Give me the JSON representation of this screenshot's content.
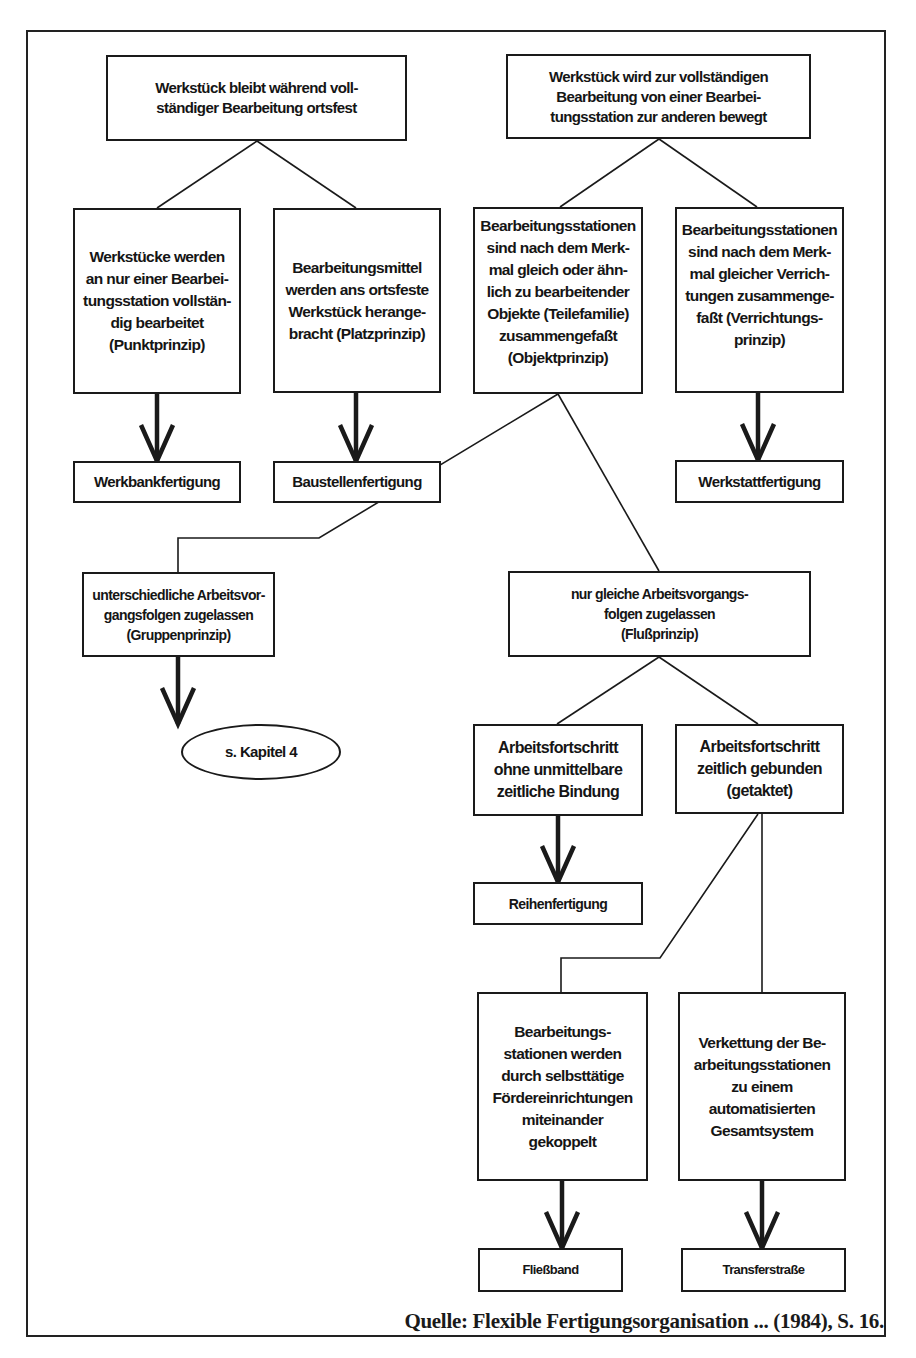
{
  "diagram": {
    "title_nodes": {
      "stationary": "Werkstück bleibt während voll-\nständiger Bearbeitung ortsfest",
      "moving": "Werkstück wird zur vollständigen\nBearbeitung von einer Bearbei-\ntungsstation zur anderen bewegt"
    },
    "nodes": {
      "punktprinzip": "Werkstücke werden\nan nur einer Bearbei-\ntungsstation vollstän-\ndig bearbeitet\n(Punktprinzip)",
      "platzprinzip": "Bearbeitungsmittel\nwerden ans ortsfeste\nWerkstück herange-\nbracht (Platzprinzip)",
      "objektprinzip": "Bearbeitungsstationen\nsind nach dem Merk-\nmal gleich oder ähn-\nlich zu bearbeitender\nObjekte (Teilefamilie)\nzusammengefaßt\n(Objektprinzip)",
      "verrichtungsprinzip": "Bearbeitungsstationen\nsind nach dem Merk-\nmal gleicher Verrich-\ntungen zusammenge-\nfaßt (Verrichtungs-\nprinzip)",
      "werkbankfertigung": "Werkbankfertigung",
      "baustellenfertigung": "Baustellenfertigung",
      "werkstattfertigung": "Werkstattfertigung",
      "gruppenprinzip": "unterschiedliche Arbeitsvor-\ngangsfolgen zugelassen\n(Gruppenprinzip)",
      "flussprinzip": "nur gleiche Arbeitsvorgangs-\nfolgen zugelassen\n(Flußprinzip)",
      "kapitel4": "s. Kapitel 4",
      "ungebunden": "Arbeitsfortschritt\nohne unmittelbare\nzeitliche Bindung",
      "getaktet": "Arbeitsfortschritt\nzeitlich gebunden\n(getaktet)",
      "reihenfertigung": "Reihenfertigung",
      "foerdereinrichtungen": "Bearbeitungs-\nstationen werden\ndurch selbsttätige\nFördereinrichtungen\nmiteinander\ngekoppelt",
      "verkettung": "Verkettung der Be-\narbeitungsstationen\nzu einem\nautomatisierten\nGesamtsystem",
      "fliessband": "Fließband",
      "transferstrasse": "Transferstraße"
    },
    "caption": "Quelle: Flexible Fertigungsorganisation ... (1984), S. 16.",
    "colors": {
      "ink": "#1a1a1a",
      "background": "#ffffff"
    }
  }
}
